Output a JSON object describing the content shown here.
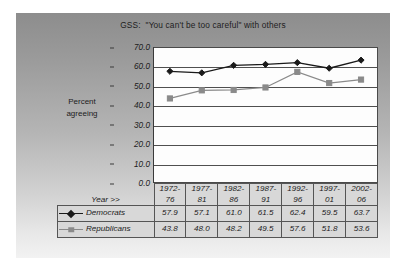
{
  "chart_data": {
    "type": "line",
    "title": "GSS:  \"You can't be too careful\" with others",
    "xlabel": "Year >>",
    "ylabel": "Percent agreeing",
    "ylim": [
      0,
      70
    ],
    "yticks": [
      "0.0",
      "10.0",
      "20.0",
      "30.0",
      "40.0",
      "50.0",
      "60.0",
      "70.0"
    ],
    "ytick_values": [
      0,
      10,
      20,
      30,
      40,
      50,
      60,
      70
    ],
    "grid": true,
    "legend_position": "bottom-table",
    "categories": [
      "1972-\n76",
      "1977-\n81",
      "1982-\n86",
      "1987-\n91",
      "1992-\n96",
      "1997-\n01",
      "2002-\n06"
    ],
    "categories_flat": [
      "1972-76",
      "1977-81",
      "1982-86",
      "1987-91",
      "1992-96",
      "1997-01",
      "2002-06"
    ],
    "series": [
      {
        "name": "Democrats",
        "marker": "diamond",
        "color": "#1a1a1a",
        "values": [
          57.9,
          57.1,
          61.0,
          61.5,
          62.4,
          59.5,
          63.7
        ],
        "labels": [
          "57.9",
          "57.1",
          "61.0",
          "61.5",
          "62.4",
          "59.5",
          "63.7"
        ]
      },
      {
        "name": "Republicans",
        "marker": "square",
        "color": "#8a8a8a",
        "values": [
          43.8,
          48.0,
          48.2,
          49.5,
          57.6,
          51.8,
          53.6
        ],
        "labels": [
          "43.8",
          "48.0",
          "48.2",
          "49.5",
          "57.6",
          "51.8",
          "53.6"
        ]
      }
    ]
  },
  "axis": {
    "y_label_line1": "Percent",
    "y_label_line2": "agreeing",
    "year_row_label": "Year >>"
  },
  "colors": {
    "democrats": "#1a1a1a",
    "republicans": "#8a8a8a",
    "gridline": "#4f4f4f",
    "plot_bg": "#fdfdfd",
    "table_cell_bg": "#d6d6d6"
  }
}
